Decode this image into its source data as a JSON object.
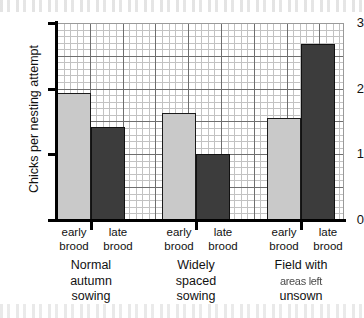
{
  "chart_data": {
    "type": "bar",
    "title": "",
    "xlabel": "",
    "ylabel": "Chicks per nesting attempt",
    "ylim": [
      0,
      3
    ],
    "yticks": [
      "0",
      "1",
      "2",
      "3"
    ],
    "grid": true,
    "legend": "none",
    "categories": [
      "Normal autumn sowing",
      "Widely spaced sowing",
      "Field with areas left unsown"
    ],
    "series": [
      {
        "name": "early brood",
        "color": "#c9c9c9",
        "values": [
          1.93,
          1.63,
          1.55
        ]
      },
      {
        "name": "late brood",
        "color": "#3c3c3c",
        "values": [
          1.42,
          1.0,
          2.68
        ]
      }
    ],
    "groups": [
      {
        "title_lines": [
          "Normal",
          "autumn",
          "sowing"
        ],
        "bars": [
          {
            "label_line1": "early",
            "label_line2": "brood",
            "value": 1.93,
            "style": "light"
          },
          {
            "label_line1": "late",
            "label_line2": "brood",
            "value": 1.42,
            "style": "dark"
          }
        ]
      },
      {
        "title_lines": [
          "Widely",
          "spaced",
          "sowing"
        ],
        "bars": [
          {
            "label_line1": "early",
            "label_line2": "brood",
            "value": 1.63,
            "style": "light"
          },
          {
            "label_line1": "late",
            "label_line2": "brood",
            "value": 1.0,
            "style": "dark"
          }
        ]
      },
      {
        "title_lines": [
          "Field with",
          "areas left",
          "unsown"
        ],
        "bars": [
          {
            "label_line1": "early",
            "label_line2": "brood",
            "value": 1.55,
            "style": "light"
          },
          {
            "label_line1": "late",
            "label_line2": "brood",
            "value": 2.68,
            "style": "dark"
          }
        ]
      }
    ]
  },
  "axis": {
    "y_title": "Chicks per nesting attempt",
    "tick_3": "3",
    "tick_2": "2",
    "tick_1": "1",
    "tick_0": "0"
  },
  "labels": {
    "g1b1_l1": "early",
    "g1b1_l2": "brood",
    "g1b2_l1": "late",
    "g1b2_l2": "brood",
    "g2b1_l1": "early",
    "g2b1_l2": "brood",
    "g2b2_l1": "late",
    "g2b2_l2": "brood",
    "g3b1_l1": "early",
    "g3b1_l2": "brood",
    "g3b2_l1": "late",
    "g3b2_l2": "brood",
    "g1t1": "Normal",
    "g1t2": "autumn",
    "g1t3": "sowing",
    "g2t1": "Widely",
    "g2t2": "spaced",
    "g2t3": "sowing",
    "g3t1": "Field with",
    "g3t2": "areas left",
    "g3t3": "unsown"
  }
}
